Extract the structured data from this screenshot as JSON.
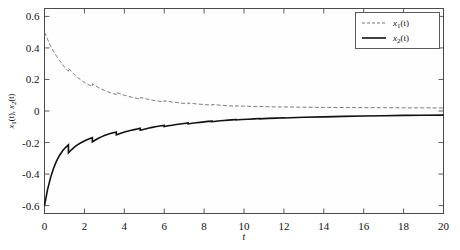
{
  "chart_data": {
    "type": "line",
    "title": "",
    "xlabel": "t",
    "ylabel": "x1(t), x2(t)",
    "xlim": [
      0,
      20
    ],
    "ylim": [
      -0.65,
      0.65
    ],
    "xticks": [
      0,
      2,
      4,
      6,
      8,
      10,
      12,
      14,
      16,
      18,
      20
    ],
    "xticklabels": [
      "0",
      "2",
      "4",
      "6",
      "8",
      "10",
      "12",
      "14",
      "16",
      "18",
      "20"
    ],
    "yticks": [
      -0.6,
      -0.4,
      -0.2,
      0,
      0.2,
      0.4,
      0.6
    ],
    "yticklabels": [
      "-0.6",
      "-0.4",
      "-0.2",
      "0",
      "0.2",
      "0.4",
      "0.6"
    ],
    "grid": false,
    "legend_position": "upper right",
    "impulse_times": [
      1.2,
      2.4,
      3.6,
      4.8,
      6.0,
      7.2,
      8.4,
      9.6,
      10.8,
      12.0
    ],
    "series": [
      {
        "name": "x1(t)",
        "label_base": "x",
        "label_sub": "1",
        "label_arg": "(t)",
        "style": "dashed",
        "color": "#6b6b6b",
        "x": [
          0,
          0.15,
          0.3,
          0.45,
          0.6,
          0.75,
          0.9,
          1.05,
          1.2,
          1.2,
          1.35,
          1.5,
          1.65,
          1.8,
          1.95,
          2.1,
          2.25,
          2.4,
          2.4,
          2.55,
          2.7,
          2.85,
          3.0,
          3.15,
          3.3,
          3.45,
          3.6,
          3.6,
          3.75,
          3.9,
          4.05,
          4.2,
          4.35,
          4.5,
          4.65,
          4.8,
          4.8,
          4.95,
          5.1,
          5.25,
          5.4,
          5.55,
          5.7,
          5.85,
          6.0,
          6.0,
          6.2,
          6.4,
          6.6,
          6.8,
          7.0,
          7.2,
          7.2,
          7.4,
          7.6,
          7.8,
          8.0,
          8.2,
          8.4,
          8.4,
          8.6,
          8.8,
          9.0,
          9.2,
          9.4,
          9.6,
          9.6,
          9.9,
          10.2,
          10.5,
          10.8,
          10.8,
          11.2,
          11.6,
          12.0,
          12.0,
          13.0,
          14.0,
          15.0,
          16.0,
          17.0,
          18.0,
          19.0,
          20.0
        ],
        "y": [
          0.5,
          0.455,
          0.415,
          0.38,
          0.348,
          0.32,
          0.295,
          0.272,
          0.252,
          0.272,
          0.25,
          0.231,
          0.214,
          0.199,
          0.186,
          0.174,
          0.164,
          0.155,
          0.172,
          0.16,
          0.149,
          0.139,
          0.131,
          0.123,
          0.116,
          0.11,
          0.105,
          0.118,
          0.111,
          0.104,
          0.098,
          0.093,
          0.088,
          0.084,
          0.08,
          0.076,
          0.086,
          0.081,
          0.077,
          0.073,
          0.069,
          0.066,
          0.063,
          0.06,
          0.058,
          0.065,
          0.061,
          0.057,
          0.054,
          0.051,
          0.048,
          0.046,
          0.051,
          0.048,
          0.045,
          0.043,
          0.041,
          0.039,
          0.037,
          0.041,
          0.039,
          0.037,
          0.035,
          0.033,
          0.032,
          0.03,
          0.033,
          0.031,
          0.03,
          0.028,
          0.027,
          0.029,
          0.027,
          0.026,
          0.025,
          0.026,
          0.024,
          0.023,
          0.022,
          0.021,
          0.021,
          0.02,
          0.02,
          0.019
        ]
      },
      {
        "name": "x2(t)",
        "label_base": "x",
        "label_sub": "2",
        "label_arg": "(t)",
        "style": "solid",
        "color": "#111111",
        "x": [
          0,
          0.15,
          0.3,
          0.45,
          0.6,
          0.75,
          0.9,
          1.05,
          1.2,
          1.2,
          1.35,
          1.5,
          1.65,
          1.8,
          1.95,
          2.1,
          2.25,
          2.4,
          2.4,
          2.55,
          2.7,
          2.85,
          3.0,
          3.15,
          3.3,
          3.45,
          3.6,
          3.6,
          3.75,
          3.9,
          4.05,
          4.2,
          4.35,
          4.5,
          4.65,
          4.8,
          4.8,
          4.95,
          5.1,
          5.25,
          5.4,
          5.55,
          5.7,
          5.85,
          6.0,
          6.0,
          6.2,
          6.4,
          6.6,
          6.8,
          7.0,
          7.2,
          7.2,
          7.4,
          7.6,
          7.8,
          8.0,
          8.2,
          8.4,
          8.4,
          8.6,
          8.8,
          9.0,
          9.2,
          9.4,
          9.6,
          9.6,
          9.9,
          10.2,
          10.5,
          10.8,
          10.8,
          11.2,
          11.6,
          12.0,
          12.0,
          13.0,
          14.0,
          15.0,
          16.0,
          17.0,
          18.0,
          19.0,
          20.0
        ],
        "y": [
          -0.6,
          -0.5,
          -0.424,
          -0.364,
          -0.318,
          -0.282,
          -0.254,
          -0.232,
          -0.215,
          -0.265,
          -0.246,
          -0.229,
          -0.215,
          -0.203,
          -0.193,
          -0.184,
          -0.176,
          -0.169,
          -0.196,
          -0.184,
          -0.173,
          -0.164,
          -0.156,
          -0.149,
          -0.143,
          -0.138,
          -0.133,
          -0.152,
          -0.145,
          -0.138,
          -0.132,
          -0.127,
          -0.122,
          -0.118,
          -0.114,
          -0.11,
          -0.122,
          -0.117,
          -0.112,
          -0.108,
          -0.104,
          -0.1,
          -0.097,
          -0.094,
          -0.091,
          -0.099,
          -0.094,
          -0.09,
          -0.086,
          -0.082,
          -0.079,
          -0.076,
          -0.082,
          -0.078,
          -0.075,
          -0.072,
          -0.069,
          -0.066,
          -0.064,
          -0.068,
          -0.065,
          -0.062,
          -0.06,
          -0.058,
          -0.056,
          -0.054,
          -0.057,
          -0.054,
          -0.052,
          -0.05,
          -0.048,
          -0.05,
          -0.047,
          -0.045,
          -0.043,
          -0.044,
          -0.04,
          -0.037,
          -0.034,
          -0.032,
          -0.03,
          -0.028,
          -0.027,
          -0.026
        ]
      }
    ]
  },
  "legend": {
    "entries": [
      {
        "label": "x1(t)",
        "base": "x",
        "sub": "1",
        "arg": "(t)",
        "style": "dashed"
      },
      {
        "label": "x2(t)",
        "base": "x",
        "sub": "2",
        "arg": "(t)",
        "style": "solid"
      }
    ]
  },
  "axes": {
    "xlabel": "t",
    "ylabel_base1": "x",
    "ylabel_sub1": "1",
    "ylabel_mid": "(t), ",
    "ylabel_base2": "x",
    "ylabel_sub2": "2",
    "ylabel_end": "(t)"
  },
  "colors": {
    "series1": "#6b6b6b",
    "series2": "#111111",
    "frame": "#4a4a4a",
    "background": "#ffffff"
  }
}
